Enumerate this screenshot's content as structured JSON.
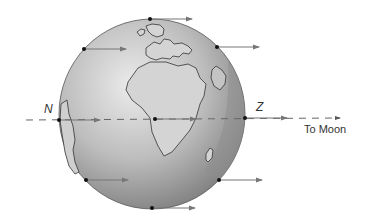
{
  "diagram": {
    "labels": {
      "near_point": "Z",
      "far_point": "N",
      "direction": "To Moon"
    },
    "colors": {
      "globe_light": "#e2e2e2",
      "globe_dark": "#8a8a8a",
      "ocean_shadow": "#9a9a9a",
      "arrow": "#777777",
      "dot": "#111111",
      "dash": "#666666"
    },
    "points": [
      {
        "name": "top",
        "x": 150,
        "y": 19,
        "arrow_to": 193
      },
      {
        "name": "upper-left",
        "x": 84,
        "y": 49,
        "arrow_to": 126
      },
      {
        "name": "upper-right",
        "x": 217,
        "y": 47,
        "arrow_to": 260
      },
      {
        "name": "N",
        "x": 59,
        "y": 120,
        "arrow_to": 101
      },
      {
        "name": "center",
        "x": 155,
        "y": 119,
        "arrow_to": 196
      },
      {
        "name": "Z",
        "x": 245,
        "y": 118,
        "arrow_to": 287
      },
      {
        "name": "lower-left",
        "x": 86,
        "y": 180,
        "arrow_to": 128
      },
      {
        "name": "lower-right",
        "x": 219,
        "y": 180,
        "arrow_to": 262
      },
      {
        "name": "bottom",
        "x": 152,
        "y": 208,
        "arrow_to": 195
      }
    ]
  }
}
